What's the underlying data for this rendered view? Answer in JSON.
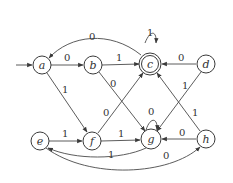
{
  "diagram": {
    "type": "finite-automaton",
    "start_state": "a",
    "accept_states": [
      "c"
    ],
    "states": [
      {
        "id": "a",
        "label": "a",
        "x": 42,
        "y": 65,
        "accept": false
      },
      {
        "id": "b",
        "label": "b",
        "x": 93,
        "y": 65,
        "accept": false
      },
      {
        "id": "c",
        "label": "c",
        "x": 150,
        "y": 64,
        "accept": true
      },
      {
        "id": "d",
        "label": "d",
        "x": 206,
        "y": 64,
        "accept": false
      },
      {
        "id": "e",
        "label": "e",
        "x": 40,
        "y": 141,
        "accept": false
      },
      {
        "id": "f",
        "label": "f",
        "x": 92,
        "y": 141,
        "accept": false
      },
      {
        "id": "g",
        "label": "g",
        "x": 151,
        "y": 139,
        "accept": false
      },
      {
        "id": "h",
        "label": "h",
        "x": 206,
        "y": 139,
        "accept": false
      }
    ],
    "transitions": [
      {
        "from": "a",
        "to": "b",
        "symbol": "0"
      },
      {
        "from": "a",
        "to": "f",
        "symbol": "1"
      },
      {
        "from": "b",
        "to": "c",
        "symbol": "1"
      },
      {
        "from": "b",
        "to": "g",
        "symbol": "0"
      },
      {
        "from": "c",
        "to": "c",
        "symbol": "1"
      },
      {
        "from": "c",
        "to": "a",
        "symbol": "0"
      },
      {
        "from": "d",
        "to": "c",
        "symbol": "0"
      },
      {
        "from": "d",
        "to": "g",
        "symbol": "1"
      },
      {
        "from": "e",
        "to": "f",
        "symbol": "1"
      },
      {
        "from": "e",
        "to": "h",
        "symbol": "0"
      },
      {
        "from": "f",
        "to": "c",
        "symbol": "0"
      },
      {
        "from": "f",
        "to": "g",
        "symbol": "1"
      },
      {
        "from": "g",
        "to": "g",
        "symbol": "0"
      },
      {
        "from": "g",
        "to": "e",
        "symbol": "1"
      },
      {
        "from": "h",
        "to": "g",
        "symbol": "0"
      },
      {
        "from": "h",
        "to": "c",
        "symbol": "1"
      }
    ]
  },
  "labels": {
    "a": "a",
    "b": "b",
    "c": "c",
    "d": "d",
    "e": "e",
    "f": "f",
    "g": "g",
    "h": "h",
    "ab": "0",
    "af": "1",
    "bc": "1",
    "bg": "0",
    "cc": "1",
    "ca": "0",
    "dc": "0",
    "dg": "1",
    "ef": "1",
    "eh": "0",
    "fc": "0",
    "fg": "1",
    "gg": "0",
    "ge": "1",
    "hg": "0",
    "hc": "1"
  }
}
